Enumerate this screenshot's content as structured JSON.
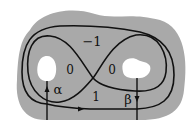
{
  "diagram": {
    "type": "surface-with-curves",
    "colors": {
      "surface": "#a9a9a9",
      "holes": "#ffffff",
      "curves": "#111111",
      "background": "#ffffff"
    },
    "region_labels": {
      "top": "−1",
      "left_lobe": "0",
      "right_lobe": "0",
      "bottom": "1"
    },
    "arc_labels": {
      "alpha": "α",
      "beta": "β"
    },
    "elements": [
      "surface-of-genus-two-region",
      "left-hole",
      "right-hole",
      "figure-eight-curve",
      "outer-loop-curve",
      "alpha-arc",
      "beta-arc"
    ]
  }
}
